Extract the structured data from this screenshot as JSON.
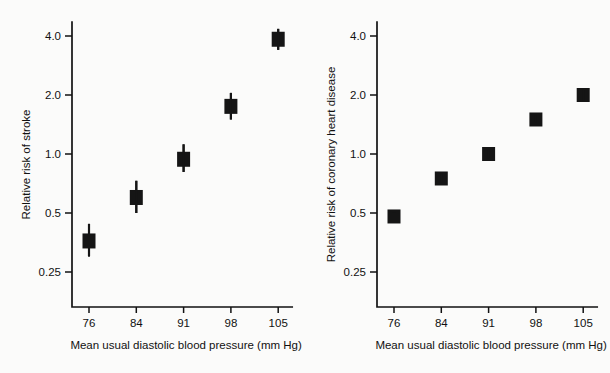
{
  "figure": {
    "background_color": "#fbfbfa",
    "ink_color": "#151515"
  },
  "chart_data": [
    {
      "type": "scatter",
      "panel": "left",
      "title": "",
      "xlabel": "Mean usual diastolic blood pressure (mm Hg)",
      "ylabel": "Relative risk of stroke",
      "yscale": "log",
      "grid": false,
      "legend": "none",
      "categories": [
        "76",
        "84",
        "91",
        "98",
        "105"
      ],
      "x": [
        76,
        84,
        91,
        98,
        105
      ],
      "ytick_labels": [
        "4.0",
        "2.0",
        "1.0",
        "0.5",
        "0.25"
      ],
      "ytick_values": [
        4.0,
        2.0,
        1.0,
        0.5,
        0.25
      ],
      "ylim": [
        0.2,
        4.8
      ],
      "values": [
        0.36,
        0.6,
        0.94,
        1.75,
        3.85
      ],
      "err_low": [
        0.3,
        0.5,
        0.81,
        1.5,
        3.4
      ],
      "err_high": [
        0.44,
        0.73,
        1.12,
        2.05,
        4.35
      ]
    },
    {
      "type": "scatter",
      "panel": "right",
      "title": "",
      "xlabel": "Mean usual diastolic blood pressure (mm Hg)",
      "ylabel": "Relative risk of coronary heart disease",
      "yscale": "log",
      "grid": false,
      "legend": "none",
      "categories": [
        "76",
        "84",
        "91",
        "98",
        "105"
      ],
      "x": [
        76,
        84,
        91,
        98,
        105
      ],
      "ytick_labels": [
        "4.0",
        "2.0",
        "1.0",
        "0.5",
        "0.25"
      ],
      "ytick_values": [
        4.0,
        2.0,
        1.0,
        0.5,
        0.25
      ],
      "ylim": [
        0.2,
        4.8
      ],
      "values": [
        0.48,
        0.75,
        1.0,
        1.5,
        2.0
      ],
      "err_low": [
        0.455,
        0.715,
        0.95,
        1.44,
        1.87
      ],
      "err_high": [
        0.505,
        0.795,
        1.06,
        1.57,
        2.14
      ]
    }
  ]
}
